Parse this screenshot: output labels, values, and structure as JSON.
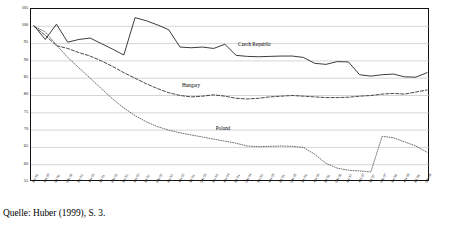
{
  "caption": "Quelle: Huber (1999), S. 3.",
  "chart_data": {
    "type": "line",
    "title": "",
    "xlabel": "",
    "ylabel": "",
    "ylim": [
      55,
      105
    ],
    "ytick_step": 5,
    "yticks": [
      105,
      100,
      95,
      90,
      85,
      80,
      75,
      70,
      65,
      60,
      55
    ],
    "grid": true,
    "grid_orientation": "horizontal",
    "legend_position": "inline-annotation",
    "x": [
      "Jan 90",
      "Apr 90",
      "Jul 90",
      "Okt 90",
      "Jan 91",
      "Apr 91",
      "Jul 91",
      "Okt 91",
      "Jan 92",
      "Apr 92",
      "Jul 92",
      "Okt 92",
      "Jan 93",
      "Apr 93",
      "Jul 93",
      "Okt 93",
      "Jan 94",
      "Apr 94",
      "Jul 94",
      "Okt 94",
      "Jan 95",
      "Apr 95",
      "Jul 95",
      "Okt 95",
      "Jan 96",
      "Apr 96",
      "Jul 96",
      "Okt 96",
      "Jan 97",
      "Apr 97",
      "Jul 97",
      "Okt 97",
      "Jan 98",
      "Apr 98",
      "Jul 98",
      "Okt 98"
    ],
    "series": [
      {
        "name": "Czech Republic",
        "style": "solid",
        "color": "#1a1a1a",
        "label_x_index": 18,
        "values": [
          100.2,
          96.2,
          100.6,
          95.4,
          96.2,
          96.6,
          95.0,
          93.4,
          91.7,
          102.5,
          101.6,
          100.4,
          99.0,
          94.0,
          93.8,
          94.0,
          93.6,
          94.8,
          91.6,
          91.3,
          91.2,
          91.3,
          91.4,
          91.4,
          91.0,
          89.3,
          89.0,
          89.8,
          89.7,
          86.0,
          85.6,
          86.0,
          86.2,
          85.4,
          85.3,
          86.6
        ]
      },
      {
        "name": "Hungary",
        "style": "dashed",
        "color": "#1a1a1a",
        "label_x_index": 13,
        "values": [
          100.0,
          97.4,
          94.4,
          93.6,
          92.4,
          91.4,
          90.0,
          88.4,
          86.6,
          85.0,
          83.4,
          82.0,
          80.8,
          80.0,
          79.6,
          79.8,
          80.2,
          79.8,
          79.2,
          79.0,
          79.2,
          79.6,
          79.8,
          80.0,
          79.8,
          79.6,
          79.4,
          79.4,
          79.5,
          79.8,
          80.0,
          80.4,
          80.6,
          80.4,
          81.0,
          81.6
        ]
      },
      {
        "name": "Poland",
        "style": "dotted",
        "color": "#4a4a4a",
        "label_x_index": 16,
        "values": [
          100.0,
          98.4,
          94.6,
          91.0,
          88.0,
          85.0,
          82.0,
          79.0,
          76.4,
          74.2,
          72.4,
          71.0,
          70.0,
          69.2,
          68.6,
          68.0,
          67.4,
          66.8,
          66.2,
          65.4,
          65.2,
          65.3,
          65.4,
          65.3,
          65.0,
          63.0,
          60.4,
          59.0,
          58.4,
          58.2,
          57.9,
          68.2,
          67.8,
          66.6,
          65.4,
          63.6
        ]
      }
    ]
  }
}
